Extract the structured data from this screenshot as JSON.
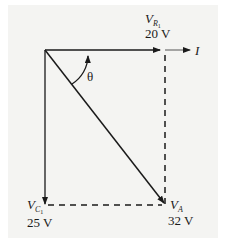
{
  "diagram": {
    "type": "phasor-diagram",
    "labels": {
      "vr": {
        "symbol": "V",
        "subscript": "R",
        "subsub": "1",
        "value": "20 V"
      },
      "current": {
        "symbol": "I"
      },
      "theta": {
        "symbol": "θ"
      },
      "vc": {
        "symbol": "V",
        "subscript": "C",
        "subsub": "1",
        "value": "25 V"
      },
      "va": {
        "symbol": "V",
        "subscript": "A",
        "value": "32 V"
      }
    },
    "colors": {
      "line": "#1a1a1a",
      "background": "#f4f4f2"
    }
  }
}
